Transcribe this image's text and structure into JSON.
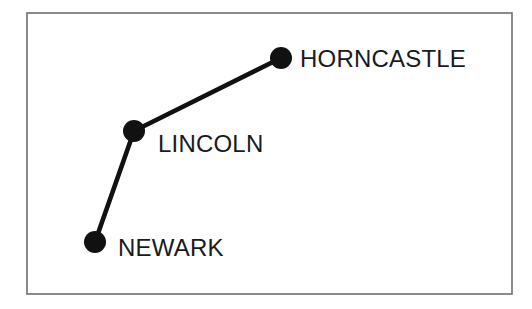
{
  "figure": {
    "kind": "schematic-route-map",
    "background_color": "#ffffff",
    "frame": {
      "x": 27,
      "y": 13,
      "width": 485,
      "height": 281,
      "stroke_color": "#6f6f72",
      "fill_color": "#ffffff"
    },
    "style": {
      "node_color": "#111111",
      "node_radius": 11,
      "edge_color": "#111111",
      "edge_width": 4.6,
      "label_color": "#1a1a1a",
      "label_font_size": 24
    }
  },
  "chart_data": {
    "type": "scatter",
    "title": "",
    "xlabel": "",
    "ylabel": "",
    "grid": false,
    "legend": "none",
    "nodes": [
      {
        "id": "horncastle",
        "label": "HORNCASTLE",
        "x": 281,
        "y": 58
      },
      {
        "id": "lincoln",
        "label": "LINCOLN",
        "x": 134,
        "y": 131
      },
      {
        "id": "newark",
        "label": "NEWARK",
        "x": 95,
        "y": 242
      }
    ],
    "edges": [
      {
        "from": "lincoln",
        "to": "horncastle"
      },
      {
        "from": "newark",
        "to": "lincoln"
      }
    ],
    "labels": [
      {
        "id": "horncastle",
        "text": "HORNCASTLE",
        "x": 300,
        "y": 67
      },
      {
        "id": "lincoln",
        "text": "LINCOLN",
        "x": 158,
        "y": 152
      },
      {
        "id": "newark",
        "text": "NEWARK",
        "x": 118,
        "y": 256
      }
    ]
  }
}
